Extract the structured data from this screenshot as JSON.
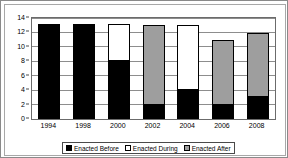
{
  "chart_data": {
    "type": "bar",
    "subtype": "stacked-bar",
    "title": "",
    "xlabel": "",
    "ylabel": "",
    "ylim": [
      0,
      14
    ],
    "ytick_step": 2,
    "yticks": [
      0,
      2,
      4,
      6,
      8,
      10,
      12,
      14
    ],
    "grid": true,
    "legend_position": "bottom",
    "categories": [
      "1994",
      "1998",
      "2000",
      "2002",
      "2004",
      "2006",
      "2008"
    ],
    "series": [
      {
        "name": "Enacted Before",
        "color": "#000000",
        "values": [
          13,
          13,
          8,
          2,
          4,
          2,
          3
        ]
      },
      {
        "name": "Enacted During",
        "color": "#ffffff",
        "values": [
          0,
          0,
          5,
          0,
          8.9,
          0,
          0
        ]
      },
      {
        "name": "Enacted After",
        "color": "#9e9e9e",
        "values": [
          0,
          0,
          0,
          10.9,
          0,
          8.8,
          8.8
        ]
      }
    ],
    "totals": [
      13,
      13,
      13,
      12.9,
      12.9,
      10.8,
      11.8
    ]
  },
  "legend": {
    "items": [
      {
        "label": "Enacted Before",
        "swatch": "#000000"
      },
      {
        "label": "Enacted During",
        "swatch": "#ffffff"
      },
      {
        "label": "Enacted After",
        "swatch": "#9e9e9e"
      }
    ]
  }
}
